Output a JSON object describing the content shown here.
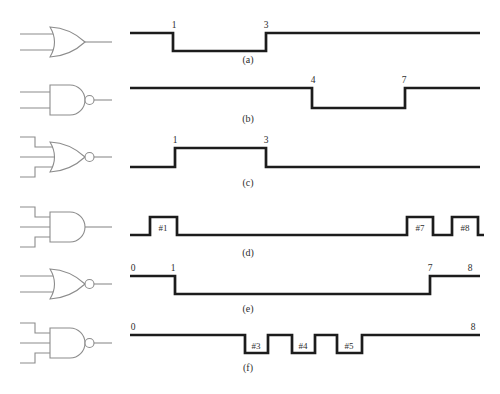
{
  "figure": {
    "background": "#ffffff",
    "line_color": "#1c1c1c",
    "gate_color": "#8c8c8c",
    "label_color": "#2e2e2e",
    "rows": [
      {
        "id": "a",
        "caption": "(a)",
        "caption_x": 248,
        "caption_y": 63,
        "gate": {
          "name": "OR",
          "type": "OR",
          "inputs": 2,
          "bubble": false,
          "cy": 42
        },
        "wave": {
          "y_high": 33,
          "y_low": 51,
          "x_start": 130,
          "x_end": 480,
          "start_level": "high",
          "toggles": [
            173,
            266
          ]
        },
        "marks": [
          {
            "label": "1",
            "x": 174
          },
          {
            "label": "3",
            "x": 266
          }
        ],
        "pulse_labels": []
      },
      {
        "id": "b",
        "caption": "(b)",
        "caption_x": 248,
        "caption_y": 122,
        "gate": {
          "name": "NAND",
          "type": "AND",
          "inputs": 2,
          "bubble": true,
          "cy": 100
        },
        "wave": {
          "y_high": 88,
          "y_low": 108,
          "x_start": 130,
          "x_end": 480,
          "start_level": "high",
          "toggles": [
            312,
            405
          ]
        },
        "marks": [
          {
            "label": "4",
            "x": 313
          },
          {
            "label": "7",
            "x": 404
          }
        ],
        "pulse_labels": []
      },
      {
        "id": "c",
        "caption": "(c)",
        "caption_x": 248,
        "caption_y": 186,
        "gate": {
          "name": "NOR",
          "type": "OR",
          "inputs": 3,
          "bubble": true,
          "cy": 157
        },
        "wave": {
          "y_high": 148,
          "y_low": 167,
          "x_start": 130,
          "x_end": 480,
          "start_level": "low",
          "toggles": [
            175,
            266
          ]
        },
        "marks": [
          {
            "label": "1",
            "x": 175
          },
          {
            "label": "3",
            "x": 266
          }
        ],
        "pulse_labels": []
      },
      {
        "id": "d",
        "caption": "(d)",
        "caption_x": 248,
        "caption_y": 256,
        "gate": {
          "name": "AND",
          "type": "AND",
          "inputs": 3,
          "bubble": false,
          "cy": 227
        },
        "wave": {
          "y_high": 217,
          "y_low": 235,
          "x_start": 130,
          "x_end": 484,
          "start_level": "low",
          "toggles": [
            150,
            177,
            407,
            433,
            452,
            478
          ]
        },
        "marks": [],
        "pulse_labels": [
          {
            "label": "#1",
            "x": 163
          },
          {
            "label": "#7",
            "x": 420
          },
          {
            "label": "#8",
            "x": 465
          }
        ]
      },
      {
        "id": "e",
        "caption": "(e)",
        "caption_x": 248,
        "caption_y": 312,
        "gate": {
          "name": "NOR",
          "type": "OR",
          "inputs": 2,
          "bubble": true,
          "cy": 284
        },
        "wave": {
          "y_high": 276,
          "y_low": 294,
          "x_start": 130,
          "x_end": 480,
          "start_level": "high",
          "toggles": [
            175,
            430
          ]
        },
        "marks": [
          {
            "label": "0",
            "x": 133
          },
          {
            "label": "1",
            "x": 173
          },
          {
            "label": "7",
            "x": 430
          },
          {
            "label": "8",
            "x": 470
          }
        ],
        "pulse_labels": []
      },
      {
        "id": "f",
        "caption": "(f)",
        "caption_x": 248,
        "caption_y": 371,
        "gate": {
          "name": "NAND",
          "type": "AND",
          "inputs": 3,
          "bubble": true,
          "cy": 343
        },
        "wave": {
          "y_high": 335,
          "y_low": 353,
          "x_start": 130,
          "x_end": 480,
          "start_level": "high",
          "toggles": [
            245,
            268,
            292,
            315,
            337,
            362
          ]
        },
        "marks": [
          {
            "label": "0",
            "x": 133
          },
          {
            "label": "8",
            "x": 473
          }
        ],
        "pulse_labels": [
          {
            "label": "#3",
            "x": 256
          },
          {
            "label": "#4",
            "x": 303
          },
          {
            "label": "#5",
            "x": 349
          }
        ]
      }
    ]
  }
}
